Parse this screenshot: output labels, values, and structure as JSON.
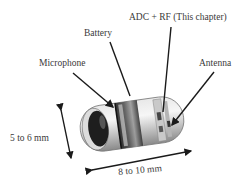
{
  "labels": {
    "adc_rf": "ADC + RF (This chapter)",
    "battery": "Battery",
    "microphone": "Microphone",
    "antenna": "Antenna",
    "height_dim": "5 to 6 mm",
    "length_dim": "8 to 10 mm"
  },
  "colors": {
    "leader_line": "#1a1a1a",
    "text": "#3a3a3a"
  }
}
